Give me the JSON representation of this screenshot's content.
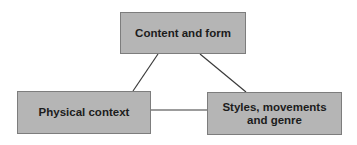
{
  "diagram": {
    "type": "concept-triangle",
    "colors": {
      "box_fill": "#b5b5b5",
      "box_border": "#7d7d7d",
      "line": "#3a3a3a",
      "text": "#1c1c1c"
    },
    "nodes": [
      {
        "id": "top",
        "label": "Content and form"
      },
      {
        "id": "left",
        "label": "Physical context"
      },
      {
        "id": "right",
        "label": "Styles, movements and genre"
      }
    ],
    "edges": [
      {
        "from": "top",
        "to": "left"
      },
      {
        "from": "top",
        "to": "right"
      },
      {
        "from": "left",
        "to": "right"
      }
    ]
  }
}
